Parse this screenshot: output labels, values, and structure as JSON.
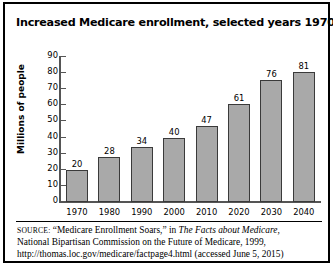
{
  "figure": {
    "title": "Increased Medicare enrollment, selected years 1970–2040",
    "border_color": "#000000",
    "background": "#ffffff"
  },
  "chart_data": {
    "type": "bar",
    "title": "Increased Medicare enrollment, selected years 1970–2040",
    "xlabel": "",
    "ylabel": "Millions of people",
    "categories": [
      "1970",
      "1980",
      "1990",
      "2000",
      "2010",
      "2020",
      "2030",
      "2040"
    ],
    "values": [
      20,
      28,
      34,
      40,
      47,
      61,
      76,
      81
    ],
    "value_labels": [
      "20",
      "28",
      "34",
      "40",
      "47",
      "61",
      "76",
      "81"
    ],
    "ylim": [
      0,
      90
    ],
    "yticks": [
      0,
      10,
      20,
      30,
      40,
      50,
      60,
      70,
      80,
      90
    ],
    "ytick_labels": [
      "0",
      "10",
      "20",
      "30",
      "40",
      "50",
      "60",
      "70",
      "80",
      "90"
    ],
    "grid": false,
    "legend": null,
    "bar_color": "#a9a9a9",
    "bar_border_color": "#3a3a3a",
    "axis_color": "#555555"
  },
  "source": {
    "label": "SOURCE:",
    "line1_a": " “Medicare Enrollment Soars,” in ",
    "line1_italic": "The Facts about Medicare,",
    "line2": "National Bipartisan Commission on the Future of Medicare, 1999,",
    "line3": "http://thomas.loc.gov/medicare/factpage4.html (accessed June 5, 2015)"
  }
}
